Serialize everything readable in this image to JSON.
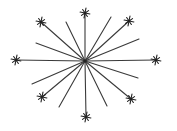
{
  "diagram": {
    "colors": {
      "background": "#ffffff",
      "line": "#3a3a3a",
      "star": "#222222"
    },
    "long_spokes": [
      {
        "id": "north",
        "terminal": "star"
      },
      {
        "id": "north-east",
        "terminal": "star"
      },
      {
        "id": "east",
        "terminal": "star"
      },
      {
        "id": "south-east",
        "terminal": "star"
      },
      {
        "id": "south",
        "terminal": "star"
      },
      {
        "id": "south-west",
        "terminal": "star"
      },
      {
        "id": "west",
        "terminal": "star"
      },
      {
        "id": "north-west",
        "terminal": "star"
      }
    ],
    "short_spokes": [
      {
        "id": "nne",
        "terminal": "none"
      },
      {
        "id": "ene",
        "terminal": "none"
      },
      {
        "id": "ese",
        "terminal": "none"
      },
      {
        "id": "sse",
        "terminal": "none"
      },
      {
        "id": "ssw",
        "terminal": "none"
      },
      {
        "id": "wsw",
        "terminal": "none"
      },
      {
        "id": "wnw",
        "terminal": "none"
      },
      {
        "id": "nnw",
        "terminal": "none"
      }
    ],
    "star_ray_count": 8
  }
}
